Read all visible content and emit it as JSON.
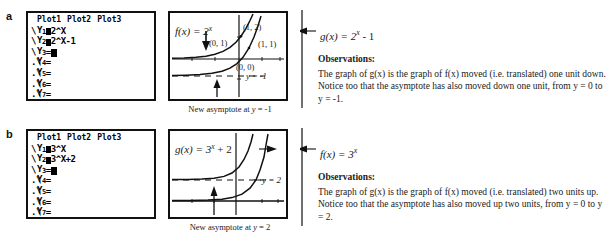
{
  "figure": {
    "parts": [
      {
        "letter": "a",
        "calculator": {
          "plots": [
            "Plot1",
            "Plot2",
            "Plot3"
          ],
          "rows": [
            {
              "label": "Y",
              "sub": "1",
              "sep": "box",
              "expr": "2^X"
            },
            {
              "label": "Y",
              "sub": "2",
              "sep": "box",
              "expr": "2^X-1"
            },
            {
              "label": "Y",
              "sub": "3",
              "sep": "=",
              "expr": "",
              "cursor": true
            },
            {
              "label": "Y",
              "sub": "4",
              "sep": "=",
              "expr": ""
            },
            {
              "label": "Y",
              "sub": "5",
              "sep": "=",
              "expr": ""
            },
            {
              "label": "Y",
              "sub": "6",
              "sep": "=",
              "expr": ""
            },
            {
              "label": "Y",
              "sub": "7",
              "sep": "=",
              "expr": ""
            }
          ]
        },
        "graph": {
          "f_label": "f(x)  =  2",
          "f_exp": "x",
          "points": [
            "(1, 2)",
            "(0, 1)",
            "(1, 1)",
            "(0, 0)"
          ],
          "asymptote_inline": "y = -1"
        },
        "caption": {
          "prefix": "New asymptote at ",
          "math": "y",
          "suffix": " = -1"
        },
        "g_label": "g(x)  =  2",
        "g_exp": "x",
        "g_tail": " - 1",
        "observations_heading": "Observations:",
        "observations_text": "The graph of g(x) is the graph of f(x) moved (i.e. translated) one unit down. Notice too that the asymptote has also moved down one unit, from y = 0 to y = -1."
      },
      {
        "letter": "b",
        "calculator": {
          "plots": [
            "Plot1",
            "Plot2",
            "Plot3"
          ],
          "rows": [
            {
              "label": "Y",
              "sub": "1",
              "sep": "box",
              "expr": "3^X"
            },
            {
              "label": "Y",
              "sub": "2",
              "sep": "box",
              "expr": "3^X+2"
            },
            {
              "label": "Y",
              "sub": "3",
              "sep": "=",
              "expr": "",
              "cursor": true
            },
            {
              "label": "Y",
              "sub": "4",
              "sep": "=",
              "expr": ""
            },
            {
              "label": "Y",
              "sub": "5",
              "sep": "=",
              "expr": ""
            },
            {
              "label": "Y",
              "sub": "6",
              "sep": "=",
              "expr": ""
            },
            {
              "label": "Y",
              "sub": "7",
              "sep": "=",
              "expr": ""
            }
          ]
        },
        "graph": {
          "g_label": "g(x)  =  3",
          "g_exp": "x",
          "g_tail": " + 2",
          "asymptote_inline": "y = 2"
        },
        "caption": {
          "prefix": "New asymptote at ",
          "math": "y",
          "suffix": " = 2"
        },
        "f_label": "f(x)  =  3",
        "f_exp": "x",
        "observations_heading": "Observations:",
        "observations_text": "The graph of g(x) is the graph of f(x) moved (i.e. translated) two units up. Notice too that the asymptote has also moved up two units, from y = 0 to y = 2."
      }
    ]
  },
  "colors": {
    "ink": "#1a1a1a",
    "frame": "#111111",
    "paper": "#ffffff"
  }
}
